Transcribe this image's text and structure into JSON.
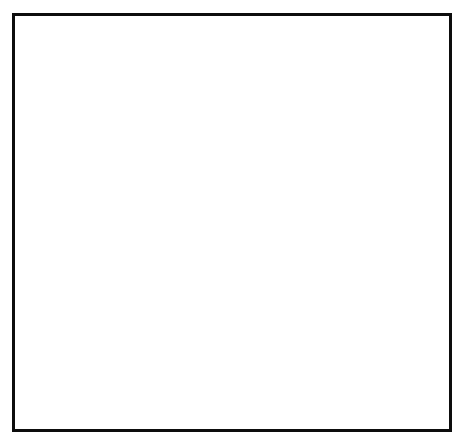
{
  "figure": {
    "frame_color": "#0d0d0d",
    "background": "#ffffff",
    "line_color": "#111111"
  },
  "axis": {
    "y_title": "EMPLOYMENT ( IN ,OOO's )",
    "x_title": "YEAR",
    "y_ticks": [
      "90",
      "80",
      "70",
      "60",
      "50",
      "40",
      "30",
      "20",
      "l0",
      "0"
    ],
    "x_ticks": [
      "'72",
      "'74",
      "'76",
      "'78",
      "'80",
      "'82",
      "'84",
      "'86",
      "'88"
    ]
  },
  "legend": {
    "items": [
      {
        "style": "solid",
        "label": "S.I.C.  28: CHEMICALS  &  ALLIED  PRODUCTS"
      },
      {
        "style": "dashdot",
        "label": "S.I.C. 282: PLASTIC  MATERIALS  &  SYNTHETICS"
      },
      {
        "style": "dashed",
        "label": "S.I.C. 286: INDUSTRIAL  ORGANIC  CHEMICALS"
      }
    ]
  },
  "chart_data": {
    "type": "line",
    "title": "",
    "xlabel": "YEAR",
    "ylabel": "EMPLOYMENT ( IN ,OOO's )",
    "xlim": [
      1972,
      1989
    ],
    "ylim": [
      0,
      90
    ],
    "ytick_values": [
      0,
      10,
      20,
      30,
      40,
      50,
      60,
      70,
      80,
      90
    ],
    "xtick_values": [
      1972,
      1974,
      1976,
      1978,
      1980,
      1982,
      1984,
      1986,
      1988
    ],
    "xtick_labels": [
      "'72",
      "'74",
      "'76",
      "'78",
      "'80",
      "'82",
      "'84",
      "'86",
      "'88"
    ],
    "minor_xticks": true,
    "grid": false,
    "legend_position": "below-axes",
    "series": [
      {
        "name": "S.I.C.  28: CHEMICALS  &  ALLIED  PRODUCTS",
        "style": "solid",
        "x": [
          1972,
          1973,
          1974,
          1975,
          1976,
          1977,
          1978,
          1979,
          1980,
          1981,
          1982,
          1983,
          1984,
          1985,
          1986,
          1987,
          1988,
          1989
        ],
        "values": [
          60.5,
          64.5,
          66.5,
          68.0,
          70.5,
          73.5,
          77.5,
          78.5,
          80.0,
          81.5,
          81.0,
          76.5,
          75.8,
          76.5,
          73.5,
          73.5,
          76.0,
          78.5
        ]
      },
      {
        "name": "S.I.C. 282: PLASTIC  MATERIALS  &  SYNTHETICS",
        "style": "dashdot",
        "x": [
          1980,
          1981,
          1982,
          1983,
          1984,
          1985,
          1986,
          1987,
          1988,
          1989
        ],
        "values": [
          39.0,
          40.0,
          39.0,
          36.5,
          34.5,
          33.5,
          33.3,
          34.0,
          34.5,
          35.3
        ]
      },
      {
        "name": "S.I.C. 286: INDUSTRIAL  ORGANIC  CHEMICALS",
        "style": "dashed",
        "x": [
          1980,
          1981,
          1982,
          1983,
          1984,
          1985,
          1986,
          1987,
          1988,
          1989
        ],
        "values": [
          10.2,
          10.6,
          9.3,
          8.0,
          7.9,
          7.9,
          7.7,
          8.6,
          8.8,
          10.2
        ]
      }
    ]
  }
}
